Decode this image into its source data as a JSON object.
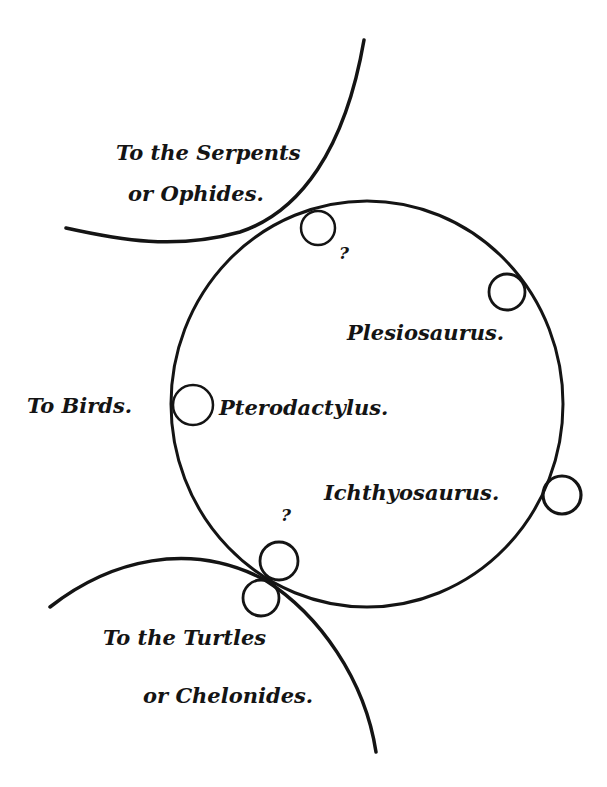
{
  "diagram": {
    "type": "quinarian-affinity-circle",
    "ink_color": "#141414",
    "background_color": "#ffffff",
    "main_circle": {
      "cx": 367,
      "cy": 404,
      "rx": 196,
      "ry": 203
    },
    "outer_arcs": [
      {
        "id": "serpents-arc",
        "label_lines": [
          "To the Serpents",
          "or Ophides."
        ]
      },
      {
        "id": "turtles-arc",
        "label_lines": [
          "To the Turtles",
          "or Chelonides."
        ]
      }
    ],
    "labels": {
      "serpents_line1": "To the Serpents",
      "serpents_line2": "or Ophides.",
      "unknown_top": "?",
      "plesiosaurus": "Plesiosaurus.",
      "to_birds": "To Birds.",
      "pterodactylus": "Pterodactylus.",
      "ichthyosaurus": "Ichthyosaurus.",
      "unknown_bottom": "?",
      "turtles_line1": "To the Turtles",
      "turtles_line2": "or Chelonides."
    },
    "nodes": [
      {
        "name": "unknown-top",
        "label": "?",
        "cx": 318,
        "cy": 228,
        "r": 17
      },
      {
        "name": "plesiosaurus",
        "label": "Plesiosaurus.",
        "cx": 507,
        "cy": 292,
        "r": 18
      },
      {
        "name": "pterodactylus",
        "label": "Pterodactylus.",
        "cx": 193,
        "cy": 405,
        "r": 20
      },
      {
        "name": "ichthyosaurus",
        "label": "Ichthyosaurus.",
        "cx": 562,
        "cy": 495,
        "r": 19
      },
      {
        "name": "unknown-bottom",
        "label": "?",
        "cx": 279,
        "cy": 561,
        "r": 19
      },
      {
        "name": "turtles-link",
        "label": "",
        "cx": 261,
        "cy": 598,
        "r": 18
      }
    ]
  }
}
